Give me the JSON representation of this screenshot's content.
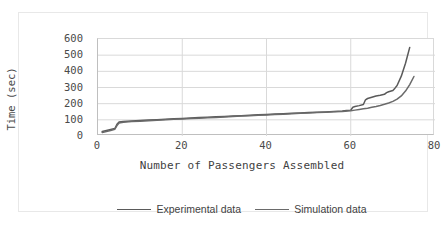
{
  "chart_data": {
    "type": "line",
    "title": "",
    "xlabel": "Number of Passengers Assembled",
    "ylabel": "Time (sec)",
    "xlim": [
      0,
      80
    ],
    "ylim": [
      0,
      600
    ],
    "xticks": [
      0,
      20,
      40,
      60,
      80
    ],
    "yticks": [
      0,
      100,
      200,
      300,
      400,
      500,
      600
    ],
    "grid": "horizontal-and-vertical",
    "legend_position": "bottom-center",
    "line_color": "#5a5a5a",
    "series": [
      {
        "name": "Experimental data",
        "color": "#5a5a5a",
        "x": [
          1,
          2,
          3,
          4,
          4.5,
          5,
          6,
          8,
          10,
          12,
          14,
          16,
          18,
          20,
          22,
          24,
          26,
          28,
          30,
          32,
          34,
          36,
          38,
          40,
          42,
          44,
          46,
          48,
          50,
          52,
          54,
          56,
          58,
          59,
          60,
          60.5,
          61,
          62,
          63,
          63.5,
          64,
          65,
          66,
          67,
          68,
          68.5,
          69,
          70,
          70.5,
          71,
          72,
          73,
          74
        ],
        "values": [
          28,
          34,
          40,
          46,
          72,
          86,
          90,
          93,
          96,
          99,
          101,
          104,
          106,
          109,
          111,
          114,
          116,
          119,
          121,
          124,
          126,
          128,
          131,
          133,
          136,
          138,
          140,
          142,
          145,
          147,
          149,
          151,
          154,
          157,
          160,
          178,
          182,
          188,
          195,
          224,
          232,
          240,
          248,
          252,
          258,
          268,
          274,
          282,
          296,
          312,
          370,
          450,
          548
        ]
      },
      {
        "name": "Simulation data",
        "color": "#6a6a6a",
        "x": [
          1,
          2,
          3,
          4,
          4.5,
          5,
          6,
          8,
          10,
          12,
          14,
          16,
          18,
          20,
          22,
          24,
          26,
          28,
          30,
          32,
          34,
          36,
          38,
          40,
          42,
          44,
          46,
          48,
          50,
          52,
          54,
          56,
          58,
          60,
          61,
          62,
          63,
          64,
          65,
          66,
          67,
          68,
          69,
          70,
          71,
          72,
          73,
          74,
          75
        ],
        "values": [
          22,
          28,
          34,
          42,
          64,
          80,
          85,
          89,
          92,
          95,
          98,
          100,
          103,
          105,
          108,
          110,
          113,
          115,
          118,
          120,
          123,
          125,
          128,
          130,
          133,
          135,
          137,
          140,
          142,
          145,
          147,
          150,
          152,
          156,
          160,
          164,
          168,
          172,
          178,
          183,
          189,
          196,
          204,
          214,
          228,
          248,
          278,
          318,
          368
        ]
      }
    ]
  },
  "legend": {
    "items": [
      {
        "label": "Experimental data"
      },
      {
        "label": "Simulation data"
      }
    ]
  }
}
